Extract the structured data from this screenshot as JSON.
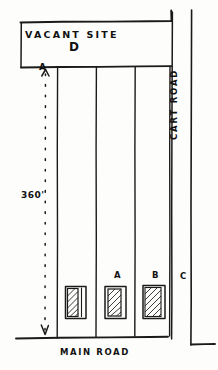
{
  "drawing": {
    "title": "Hand-drawn site plan sketch",
    "ink_color": "#1a1a1a",
    "paper_color": "#fdfdfb"
  },
  "labels": {
    "vacant_site": "VACANT SITE",
    "vacant_site_plot": "D",
    "dimension_length": "360'",
    "datum_point_top": "A",
    "plot_a": "A",
    "plot_b": "B",
    "plot_c": "C",
    "main_road": "MAIN  ROAD",
    "cart_road": "CART  ROAD"
  },
  "plots": [
    {
      "id": "strip-1",
      "label": "",
      "has_building": true
    },
    {
      "id": "strip-2",
      "label": "A",
      "has_building": true
    },
    {
      "id": "strip-3",
      "label": "B",
      "has_building": true
    },
    {
      "id": "strip-4",
      "label": "C",
      "has_building": false
    }
  ],
  "dimension": {
    "value": "360'",
    "orientation": "vertical",
    "style": "dashed-with-arrowheads",
    "from": "A",
    "to": "MAIN  ROAD"
  }
}
